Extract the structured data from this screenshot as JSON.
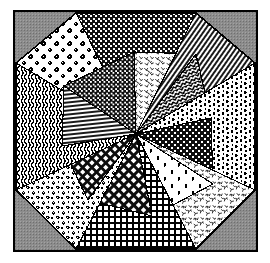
{
  "figure": {
    "name": "quilt-block-diagram",
    "canvas": {
      "width": 270,
      "height": 263,
      "background": "#ffffff"
    }
  },
  "frame": {
    "name": "outer-frame",
    "x": 13,
    "y": 10,
    "width": 245,
    "height": 242,
    "border_color": "#000000",
    "border_width": 2,
    "corner_fill": "#8c8c8c",
    "corner_pattern": "halftone-dots"
  },
  "octagon": {
    "name": "octagon-outline",
    "center_x": 136,
    "center_y": 134,
    "stroke": "#000000",
    "stroke_width": 1.1,
    "vertices": [
      {
        "x": 16,
        "y": 63
      },
      {
        "x": 76,
        "y": 13
      },
      {
        "x": 196,
        "y": 13
      },
      {
        "x": 255,
        "y": 63
      },
      {
        "x": 255,
        "y": 190
      },
      {
        "x": 196,
        "y": 249
      },
      {
        "x": 76,
        "y": 249
      },
      {
        "x": 16,
        "y": 190
      }
    ]
  },
  "palette": {
    "ink": "#000000",
    "paper": "#ffffff",
    "gray": "#8c8c8c",
    "mid_gray": "#b4b4b4"
  },
  "patterns": [
    {
      "id": "rosette-print",
      "label": "Rosette floral print",
      "ground": "light",
      "density": "sparse"
    },
    {
      "id": "dense-dots",
      "label": "Dense dotted weave",
      "ground": "dark",
      "density": "heavy"
    },
    {
      "id": "sprig-print",
      "label": "Scattered sprig print",
      "ground": "light",
      "density": "medium"
    },
    {
      "id": "diagonal-stripe",
      "label": "Fine diagonal stripe",
      "ground": "light",
      "density": "medium"
    },
    {
      "id": "herringbone",
      "label": "Herringbone chevron",
      "ground": "dark",
      "density": "heavy"
    },
    {
      "id": "popcorn-texture",
      "label": "Mottled popcorn texture",
      "ground": "light",
      "density": "medium"
    },
    {
      "id": "fine-check",
      "label": "Fine dark check",
      "ground": "dark",
      "density": "heavy"
    },
    {
      "id": "vertical-stripe",
      "label": "Narrow vertical stripe",
      "ground": "dark",
      "density": "heavy"
    },
    {
      "id": "branch-print",
      "label": "Branch and leaf print",
      "ground": "light",
      "density": "medium"
    },
    {
      "id": "gingham-grid",
      "label": "Gingham grid",
      "ground": "light",
      "density": "heavy"
    },
    {
      "id": "leaf-motif",
      "label": "Leaf motif print",
      "ground": "light",
      "density": "sparse"
    },
    {
      "id": "diamond-lattice",
      "label": "Diamond lattice check",
      "ground": "dark",
      "density": "heavy"
    },
    {
      "id": "horizontal-line",
      "label": "Horizontal line stripe",
      "ground": "light",
      "density": "medium"
    },
    {
      "id": "floral-cluster",
      "label": "Floral cluster print",
      "ground": "light",
      "density": "medium"
    },
    {
      "id": "wavy-stripe",
      "label": "Wavy squiggle stripe",
      "ground": "dark",
      "density": "heavy"
    },
    {
      "id": "crosshatch",
      "label": "Crosshatch weave",
      "ground": "dark",
      "density": "heavy"
    }
  ],
  "patches": [
    {
      "name": "patch-01",
      "pattern": "rosette-print",
      "points": "136,134 76,13 16,63"
    },
    {
      "name": "patch-02",
      "pattern": "dense-dots",
      "points": "136,134 76,13 196,13"
    },
    {
      "name": "patch-03",
      "pattern": "sprig-print",
      "points": "136,134 134,52 196,54"
    },
    {
      "name": "patch-04",
      "pattern": "diagonal-stripe",
      "points": "136,134 196,13 255,63"
    },
    {
      "name": "patch-05",
      "pattern": "herringbone",
      "points": "136,134 196,54 211,118"
    },
    {
      "name": "patch-06",
      "pattern": "popcorn-texture",
      "points": "136,134 255,63 255,190"
    },
    {
      "name": "patch-07",
      "pattern": "fine-check",
      "points": "136,134 211,118 213,184"
    },
    {
      "name": "patch-08",
      "pattern": "branch-print",
      "points": "136,134 255,190 196,249"
    },
    {
      "name": "patch-09",
      "pattern": "leaf-motif",
      "points": "136,134 213,184 152,216"
    },
    {
      "name": "patch-10",
      "pattern": "gingham-grid",
      "points": "136,134 196,249 76,249"
    },
    {
      "name": "patch-11",
      "pattern": "diamond-lattice",
      "points": "136,134 152,216 88,200"
    },
    {
      "name": "patch-12",
      "pattern": "floral-cluster",
      "points": "136,134 76,249 16,190"
    },
    {
      "name": "patch-13",
      "pattern": "crosshatch",
      "points": "136,134 88,200 62,146"
    },
    {
      "name": "patch-14",
      "pattern": "wavy-stripe",
      "points": "136,134 16,190 16,63"
    },
    {
      "name": "patch-15",
      "pattern": "horizontal-line",
      "points": "136,134 62,146 64,86"
    },
    {
      "name": "patch-16",
      "pattern": "vertical-stripe",
      "points": "136,134 64,86 134,52"
    }
  ]
}
